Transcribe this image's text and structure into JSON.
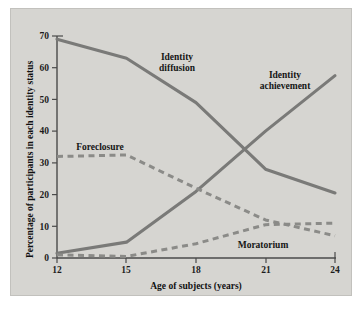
{
  "chart_data": {
    "type": "line",
    "title": "",
    "xlabel": "Age of subjects (years)",
    "ylabel": "Percentage of participants in each identity status",
    "xlim": [
      12,
      24
    ],
    "ylim": [
      0,
      70
    ],
    "xticks": [
      12,
      15,
      18,
      21,
      24
    ],
    "yticks": [
      0,
      10,
      20,
      30,
      40,
      50,
      60,
      70
    ],
    "grid": false,
    "legend": "inline-annotations",
    "x": [
      12,
      15,
      18,
      21,
      24
    ],
    "series": [
      {
        "name": "Identity diffusion",
        "style": "solid",
        "color": "#7a7a78",
        "values": [
          69,
          63,
          49,
          28,
          20.5
        ],
        "label_x": 18.0,
        "label_y": 59.0
      },
      {
        "name": "Identity achievement",
        "style": "solid",
        "color": "#7a7a78",
        "values": [
          1.5,
          5,
          21,
          40,
          57.5
        ],
        "label_x": 21.6,
        "label_y": 57.0
      },
      {
        "name": "Foreclosure",
        "style": "dashed",
        "color": "#8b8b88",
        "values": [
          32,
          32.5,
          22,
          12,
          7
        ],
        "label_x": 13.4,
        "label_y": 36.5
      },
      {
        "name": "Moratorium",
        "style": "dashed",
        "color": "#8b8b88",
        "values": [
          1,
          0.5,
          4.5,
          10.5,
          11
        ],
        "label_x": 21.5,
        "label_y": 5.0
      }
    ],
    "annotations": [
      {
        "text": "Identity diffusion",
        "line1": "Identity",
        "line2": "diffusion"
      },
      {
        "text": "Identity achievement",
        "line1": "Identity",
        "line2": "achievement"
      },
      {
        "text": "Foreclosure",
        "line1": "Foreclosure",
        "line2": ""
      },
      {
        "text": "Moratorium",
        "line1": "Moratorium",
        "line2": ""
      }
    ],
    "tick_labels_x": [
      "12",
      "15",
      "18",
      "21",
      "24"
    ],
    "tick_labels_y": [
      "0",
      "10",
      "20",
      "30",
      "40",
      "50",
      "60",
      "70"
    ]
  },
  "figure": {
    "panel_background": "#d6d5d1",
    "page_background": "#ffffff",
    "axis_color": "#4a4a4a",
    "line_color": "#7a7a78"
  }
}
